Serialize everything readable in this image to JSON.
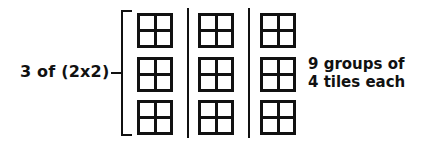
{
  "figure": {
    "background_color": "#ffffff",
    "ink_color": "#111111"
  },
  "left_label": {
    "text": "3 of (2x2)"
  },
  "right_label": {
    "line1": "9 groups of",
    "line2": "4 tiles each"
  },
  "chart_data": {
    "type": "diagram",
    "columns": 3,
    "tiles_per_column": 3,
    "cells_per_tile": 4,
    "total_groups": 9,
    "total_tiles": 36,
    "annotations": [
      "3 of (2x2)",
      "9 groups of",
      "4 tiles each"
    ]
  },
  "structure": {
    "columns": [
      {
        "name": "column-1",
        "tiles": [
          {
            "name": "tile-1-1"
          },
          {
            "name": "tile-1-2"
          },
          {
            "name": "tile-1-3"
          }
        ]
      },
      {
        "name": "column-2",
        "tiles": [
          {
            "name": "tile-2-1"
          },
          {
            "name": "tile-2-2"
          },
          {
            "name": "tile-2-3"
          }
        ]
      },
      {
        "name": "column-3",
        "tiles": [
          {
            "name": "tile-3-1"
          },
          {
            "name": "tile-3-2"
          },
          {
            "name": "tile-3-3"
          }
        ]
      }
    ]
  }
}
